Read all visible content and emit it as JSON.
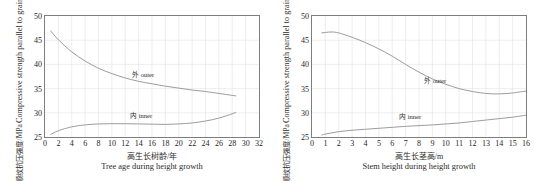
{
  "figure": {
    "shared_ylabel_cn": "顺纹抗压强度/MPa",
    "shared_ylabel_en": "Compressive strength parallel to grain"
  },
  "chart_data": [
    {
      "type": "line",
      "panel": "left",
      "title": "",
      "xlabel_cn": "高生长树龄/年",
      "xlabel_en": "Tree age during height growth",
      "ylabel_cn": "顺纹抗压强度/MPa",
      "ylabel_en": "Compressive strength parallel to grain",
      "xlim": [
        0,
        32
      ],
      "ylim": [
        25,
        50
      ],
      "xticks": [
        0,
        2,
        4,
        6,
        8,
        10,
        12,
        14,
        16,
        18,
        20,
        22,
        24,
        26,
        28,
        30,
        32
      ],
      "yticks": [
        25,
        30,
        35,
        40,
        45,
        50
      ],
      "grid": true,
      "legend_position": "inline-annotation",
      "line_color": "#8a8a8a",
      "series": [
        {
          "name": "外 outer",
          "label_cn": "外",
          "label_en": "outer",
          "x": [
            0.8,
            2,
            4,
            6,
            8,
            10,
            12,
            14,
            16,
            18,
            20,
            22,
            24,
            26,
            28,
            28.6
          ],
          "values": [
            47.0,
            45.1,
            42.6,
            40.7,
            39.2,
            38.1,
            37.2,
            36.5,
            36.0,
            35.5,
            35.1,
            34.7,
            34.4,
            34.0,
            33.6,
            33.5
          ]
        },
        {
          "name": "内 inner",
          "label_cn": "内",
          "label_en": "inner",
          "x": [
            0.8,
            2,
            4,
            6,
            8,
            10,
            12,
            14,
            16,
            18,
            20,
            22,
            24,
            26,
            28,
            28.6
          ],
          "values": [
            25.5,
            26.3,
            27.1,
            27.5,
            27.7,
            27.75,
            27.75,
            27.7,
            27.65,
            27.6,
            27.7,
            27.9,
            28.3,
            28.9,
            29.8,
            30.1
          ]
        }
      ]
    },
    {
      "type": "line",
      "panel": "right",
      "title": "",
      "xlabel_cn": "高生长茎高/m",
      "xlabel_en": "Stem height during height growth",
      "ylabel_cn": "顺纹抗压强度/MPa",
      "ylabel_en": "Compressive strength parallel to grain",
      "xlim": [
        0,
        16
      ],
      "ylim": [
        25,
        50
      ],
      "xticks": [
        0,
        1,
        2,
        3,
        4,
        5,
        6,
        7,
        8,
        9,
        10,
        11,
        12,
        13,
        14,
        15,
        16
      ],
      "yticks": [
        25,
        30,
        35,
        40,
        45,
        50
      ],
      "grid": true,
      "legend_position": "inline-annotation",
      "line_color": "#8a8a8a",
      "series": [
        {
          "name": "外 outer",
          "label_cn": "外",
          "label_en": "outer",
          "x": [
            0.7,
            1,
            1.5,
            2,
            3,
            4,
            5,
            6,
            7,
            8,
            9,
            10,
            11,
            12,
            13,
            14,
            15,
            16
          ],
          "values": [
            46.5,
            46.6,
            46.7,
            46.5,
            45.6,
            44.5,
            43.2,
            41.7,
            40.0,
            38.4,
            37.0,
            35.9,
            35.0,
            34.4,
            34.0,
            33.9,
            34.1,
            34.5
          ]
        },
        {
          "name": "内 inner",
          "label_cn": "内",
          "label_en": "inner",
          "x": [
            0.7,
            1,
            2,
            3,
            4,
            5,
            6,
            7,
            8,
            9,
            10,
            11,
            12,
            13,
            14,
            15,
            16
          ],
          "values": [
            25.4,
            25.6,
            26.1,
            26.4,
            26.6,
            26.8,
            27.0,
            27.2,
            27.35,
            27.5,
            27.7,
            27.9,
            28.2,
            28.5,
            28.8,
            29.1,
            29.5
          ]
        }
      ]
    }
  ]
}
